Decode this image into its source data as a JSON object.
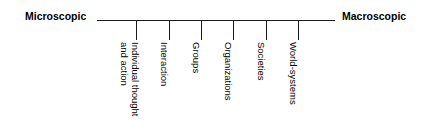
{
  "figure": {
    "name": "micro-macro-continuum",
    "orientation": "horizontal",
    "background_color": "#ffffff",
    "line_color": "#1a1a1a",
    "text_color": "#000000"
  },
  "axis": {
    "left_label": "Microscopic",
    "right_label": "Macroscopic"
  },
  "stops": [
    {
      "label_lines": [
        "Individual thought",
        "and action"
      ],
      "label": "Individual thought and action",
      "x": 136
    },
    {
      "label_lines": [
        "Interaction"
      ],
      "label": "Interaction",
      "x": 169
    },
    {
      "label_lines": [
        "Groups"
      ],
      "label": "Groups",
      "x": 201
    },
    {
      "label_lines": [
        "Organizations"
      ],
      "label": "Organizations",
      "x": 233
    },
    {
      "label_lines": [
        "Societies"
      ],
      "label": "Societies",
      "x": 266
    },
    {
      "label_lines": [
        "World-systems"
      ],
      "label": "World-systems",
      "x": 298
    }
  ],
  "chart_data": {
    "type": "diagram",
    "title": "",
    "xlabel": "",
    "ylabel": "",
    "axis_endpoints": [
      "Microscopic",
      "Macroscopic"
    ],
    "categories": [
      "Individual thought and action",
      "Interaction",
      "Groups",
      "Organizations",
      "Societies",
      "World-systems"
    ],
    "values": [
      1,
      2,
      3,
      4,
      5,
      6
    ],
    "grid": false,
    "legend": "none"
  }
}
